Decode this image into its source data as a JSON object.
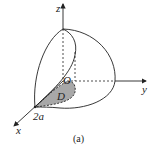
{
  "figure": {
    "caption": "(a)",
    "axes": {
      "x_label": "x",
      "y_label": "y",
      "z_label": "z",
      "origin_label": "O"
    },
    "region_label": "D",
    "point_label": "2a",
    "colors": {
      "stroke": "#222222",
      "region_fill": "#a8a8a8"
    }
  }
}
